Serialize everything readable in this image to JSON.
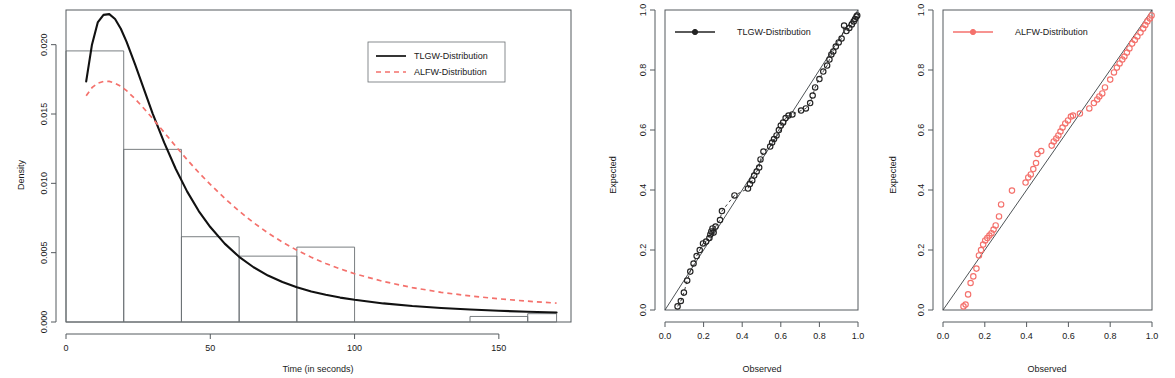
{
  "figure": {
    "panel_count": 3,
    "background": "#ffffff",
    "colors": {
      "solid_series": "#111111",
      "dashed_series": "#f4716c",
      "axis": "#555a5e",
      "frame": "#6a6f73"
    }
  },
  "panels": {
    "histogram": {
      "name": "density-histogram",
      "legend": {
        "boxed": true,
        "entries": [
          {
            "label": "TLGW-Distribution",
            "style": "solid",
            "color": "#111111"
          },
          {
            "label": "ALFW-Distribution",
            "style": "dashed",
            "color": "#f4716c"
          }
        ]
      }
    },
    "qq_tlgw": {
      "name": "qq-plot-tlgw",
      "legend": {
        "boxed": false,
        "entries": [
          {
            "label": "TLGW-Distribution",
            "style": "solid-point",
            "color": "#232323"
          }
        ]
      }
    },
    "qq_alfw": {
      "name": "qq-plot-alfw",
      "legend": {
        "boxed": false,
        "entries": [
          {
            "label": "ALFW-Distribution",
            "style": "solid-point",
            "color": "#f4716c"
          }
        ]
      }
    }
  },
  "chart_data": [
    {
      "type": "histogram",
      "title": "",
      "xlabel": "Time (in seconds)",
      "ylabel": "Density",
      "xlim": [
        0,
        175
      ],
      "ylim": [
        0,
        0.0225
      ],
      "xticks": [
        0,
        50,
        100,
        150
      ],
      "xtick_labels": [
        "0",
        "50",
        "100",
        "150"
      ],
      "yticks": [
        0.0,
        0.005,
        0.01,
        0.015,
        0.02
      ],
      "ytick_labels": [
        "0.000",
        "0.005",
        "0.010",
        "0.015",
        "0.020"
      ],
      "grid": false,
      "legend_position": "top-right",
      "bins": [
        {
          "x0": 0,
          "x1": 20,
          "density": 0.01955
        },
        {
          "x0": 20,
          "x1": 40,
          "density": 0.01245
        },
        {
          "x0": 40,
          "x1": 60,
          "density": 0.00615
        },
        {
          "x0": 60,
          "x1": 80,
          "density": 0.00475
        },
        {
          "x0": 80,
          "x1": 100,
          "density": 0.0054
        },
        {
          "x0": 140,
          "x1": 160,
          "density": 0.0004
        },
        {
          "x0": 160,
          "x1": 170,
          "density": 0.0006
        }
      ],
      "series": [
        {
          "name": "TLGW-Distribution",
          "style": "solid",
          "color": "#111111",
          "x": [
            7,
            9,
            11,
            13,
            15,
            17,
            19,
            21,
            24,
            27,
            30,
            34,
            38,
            42,
            46,
            50,
            55,
            60,
            65,
            70,
            75,
            80,
            85,
            90,
            95,
            100,
            110,
            120,
            130,
            140,
            150,
            160,
            170
          ],
          "y": [
            0.01735,
            0.02,
            0.0216,
            0.02215,
            0.0222,
            0.02185,
            0.02115,
            0.0202,
            0.01855,
            0.0168,
            0.01505,
            0.01295,
            0.01105,
            0.0094,
            0.008,
            0.00685,
            0.00565,
            0.0047,
            0.00395,
            0.00335,
            0.00288,
            0.0025,
            0.0022,
            0.00196,
            0.00176,
            0.0016,
            0.00134,
            0.00115,
            0.00101,
            0.0009,
            0.00081,
            0.00074,
            0.00068
          ]
        },
        {
          "name": "ALFW-Distribution",
          "style": "dashed",
          "color": "#f4716c",
          "x": [
            7,
            9,
            11,
            13,
            15,
            17,
            19,
            21,
            24,
            27,
            30,
            34,
            38,
            42,
            46,
            50,
            55,
            60,
            65,
            70,
            75,
            80,
            85,
            90,
            95,
            100,
            110,
            120,
            130,
            140,
            150,
            160,
            170
          ],
          "y": [
            0.01632,
            0.0169,
            0.01722,
            0.01735,
            0.01735,
            0.01722,
            0.017,
            0.01668,
            0.01608,
            0.0154,
            0.01468,
            0.01368,
            0.01268,
            0.0117,
            0.01078,
            0.00992,
            0.00892,
            0.008,
            0.00716,
            0.00642,
            0.00576,
            0.00518,
            0.00467,
            0.00422,
            0.00383,
            0.00348,
            0.00292,
            0.00248,
            0.00214,
            0.00188,
            0.00167,
            0.0015,
            0.00136
          ]
        }
      ]
    },
    {
      "type": "scatter",
      "title": "",
      "subtype": "qq-plot",
      "xlabel": "Observed",
      "ylabel": "Expected",
      "xlim": [
        0,
        1
      ],
      "ylim": [
        0,
        1
      ],
      "xticks": [
        0.0,
        0.2,
        0.4,
        0.6,
        0.8,
        1.0
      ],
      "xtick_labels": [
        "0.0",
        "0.2",
        "0.4",
        "0.6",
        "0.8",
        "1.0"
      ],
      "yticks": [
        0.0,
        0.2,
        0.4,
        0.6,
        0.8,
        1.0
      ],
      "ytick_labels": [
        "0.0",
        "0.2",
        "0.4",
        "0.6",
        "0.8",
        "1.0"
      ],
      "grid": false,
      "legend_position": "top-left",
      "reference_line": {
        "from": [
          0.0,
          0.0
        ],
        "to": [
          1.0,
          1.0
        ]
      },
      "series": [
        {
          "name": "TLGW-Distribution",
          "color": "#232323",
          "marker": "circle-open",
          "connected": true,
          "x": [
            0.065,
            0.082,
            0.098,
            0.115,
            0.131,
            0.148,
            0.164,
            0.18,
            0.197,
            0.213,
            0.23,
            0.235,
            0.24,
            0.246,
            0.252,
            0.262,
            0.285,
            0.295,
            0.36,
            0.43,
            0.44,
            0.452,
            0.462,
            0.475,
            0.488,
            0.495,
            0.51,
            0.545,
            0.555,
            0.565,
            0.578,
            0.59,
            0.6,
            0.612,
            0.625,
            0.64,
            0.66,
            0.705,
            0.73,
            0.752,
            0.765,
            0.778,
            0.8,
            0.82,
            0.84,
            0.852,
            0.862,
            0.872,
            0.885,
            0.9,
            0.915,
            0.928,
            0.94,
            0.955,
            0.968,
            0.978,
            0.985,
            0.992,
            0.996
          ],
          "y": [
            0.012,
            0.03,
            0.058,
            0.098,
            0.128,
            0.155,
            0.18,
            0.2,
            0.222,
            0.228,
            0.24,
            0.252,
            0.262,
            0.272,
            0.258,
            0.278,
            0.3,
            0.33,
            0.382,
            0.405,
            0.42,
            0.432,
            0.448,
            0.462,
            0.475,
            0.502,
            0.528,
            0.545,
            0.558,
            0.57,
            0.582,
            0.6,
            0.615,
            0.625,
            0.64,
            0.648,
            0.652,
            0.665,
            0.672,
            0.69,
            0.715,
            0.742,
            0.77,
            0.795,
            0.815,
            0.835,
            0.852,
            0.862,
            0.878,
            0.892,
            0.905,
            0.948,
            0.93,
            0.94,
            0.952,
            0.962,
            0.97,
            0.978,
            0.982
          ]
        }
      ]
    },
    {
      "type": "scatter",
      "title": "",
      "subtype": "qq-plot",
      "xlabel": "Observed",
      "ylabel": "Expected",
      "xlim": [
        0,
        1
      ],
      "ylim": [
        0,
        1
      ],
      "xticks": [
        0.0,
        0.2,
        0.4,
        0.6,
        0.8,
        1.0
      ],
      "xtick_labels": [
        "0.0",
        "0.2",
        "0.4",
        "0.6",
        "0.8",
        "1.0"
      ],
      "yticks": [
        0.0,
        0.2,
        0.4,
        0.6,
        0.8,
        1.0
      ],
      "ytick_labels": [
        "0.0",
        "0.2",
        "0.4",
        "0.6",
        "0.8",
        "1.0"
      ],
      "grid": false,
      "legend_position": "top-left",
      "reference_line": {
        "from": [
          0.0,
          0.0
        ],
        "to": [
          1.0,
          1.0
        ]
      },
      "series": [
        {
          "name": "ALFW-Distribution",
          "color": "#f4716c",
          "marker": "circle-open",
          "connected": false,
          "x": [
            0.098,
            0.108,
            0.12,
            0.132,
            0.145,
            0.16,
            0.172,
            0.182,
            0.192,
            0.202,
            0.212,
            0.222,
            0.232,
            0.242,
            0.252,
            0.268,
            0.278,
            0.33,
            0.395,
            0.408,
            0.42,
            0.432,
            0.445,
            0.452,
            0.47,
            0.52,
            0.53,
            0.542,
            0.552,
            0.562,
            0.572,
            0.585,
            0.598,
            0.612,
            0.622,
            0.655,
            0.7,
            0.722,
            0.738,
            0.748,
            0.762,
            0.775,
            0.8,
            0.818,
            0.832,
            0.845,
            0.858,
            0.868,
            0.88,
            0.892,
            0.905,
            0.918,
            0.93,
            0.945,
            0.958,
            0.968,
            0.978,
            0.99,
            0.998
          ],
          "y": [
            0.012,
            0.018,
            0.052,
            0.09,
            0.112,
            0.138,
            0.182,
            0.2,
            0.218,
            0.232,
            0.24,
            0.248,
            0.256,
            0.268,
            0.282,
            0.312,
            0.352,
            0.398,
            0.425,
            0.442,
            0.452,
            0.47,
            0.49,
            0.52,
            0.53,
            0.548,
            0.562,
            0.572,
            0.582,
            0.595,
            0.608,
            0.622,
            0.632,
            0.645,
            0.648,
            0.655,
            0.672,
            0.69,
            0.702,
            0.712,
            0.722,
            0.742,
            0.768,
            0.792,
            0.808,
            0.822,
            0.835,
            0.845,
            0.858,
            0.872,
            0.888,
            0.9,
            0.912,
            0.925,
            0.938,
            0.95,
            0.962,
            0.972,
            0.982
          ]
        }
      ]
    }
  ]
}
